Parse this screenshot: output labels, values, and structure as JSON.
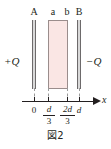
{
  "figure": {
    "caption": "図2",
    "top_labels": {
      "plate_A": "A",
      "slab_left": "a",
      "slab_right": "b",
      "plate_B": "B"
    },
    "charges": {
      "left": "+Q",
      "right": "−Q"
    },
    "axis": {
      "label": "x",
      "ticks": [
        {
          "label": "0",
          "position": "0"
        },
        {
          "numerator": "d",
          "denominator": "3",
          "position": "d/3"
        },
        {
          "numerator": "2d",
          "denominator": "3",
          "position": "2d/3"
        },
        {
          "label": "d",
          "position": "d"
        }
      ]
    },
    "colors": {
      "slab_fill": "#fae6e4",
      "slab_stroke": "#9a8d8c",
      "plate_fill": "#d9d9d9",
      "plate_stroke": "#6d6a6b",
      "ink": "#231f20",
      "dashed": "#9a9a9a"
    }
  }
}
